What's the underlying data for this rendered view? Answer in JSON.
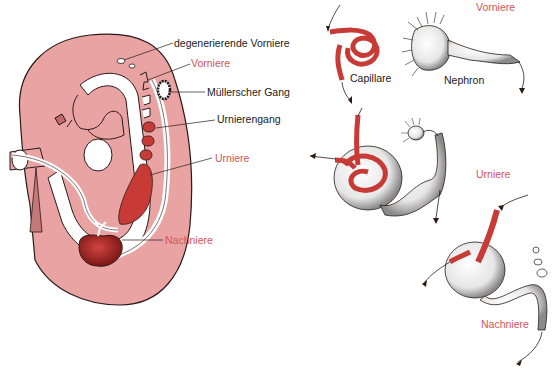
{
  "colors": {
    "tissue": "#e9a3a3",
    "tissue_dark": "#d98c8c",
    "organ_red": "#c83a36",
    "organ_dark": "#8e1d1c",
    "outline": "#2a1a1a",
    "label_red": "#d4545a",
    "label_black": "#1a1a1a"
  },
  "embryo_labels": {
    "degenerating_pronephros": "degenerierende Vorniere",
    "pronephros": "Vorniere",
    "muellerian_duct": "Müllerscher Gang",
    "mesonephric_duct": "Urnierengang",
    "mesonephros": "Urniere",
    "metanephros": "Nachniere"
  },
  "stage_labels": {
    "pronephros": "Vorniere",
    "mesonephros": "Urniere",
    "metanephros": "Nachniere"
  },
  "part_labels": {
    "capillary": "Capillare",
    "nephron": "Nephron"
  }
}
